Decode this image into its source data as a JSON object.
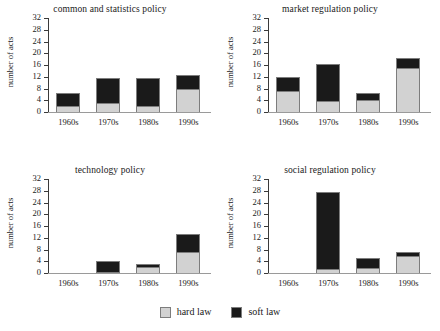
{
  "figure": {
    "ylabel": "number of acts",
    "legend": {
      "hard": {
        "label": "hard law",
        "color": "#d2d2d2",
        "swatch": "hard-law-swatch"
      },
      "soft": {
        "label": "soft law",
        "color": "#1a1a1a",
        "swatch": "soft-law-swatch"
      }
    },
    "yticks": [
      "0",
      "4",
      "8",
      "12",
      "16",
      "20",
      "24",
      "28",
      "32"
    ],
    "xticks": [
      "1960s",
      "1970s",
      "1980s",
      "1990s"
    ]
  },
  "chart_data": [
    {
      "type": "bar",
      "title": "common and statistics policy",
      "xlabel": "",
      "ylabel": "number of acts",
      "ylim": [
        0,
        32
      ],
      "yticks": [
        0,
        4,
        8,
        12,
        16,
        20,
        24,
        28,
        32
      ],
      "grid": false,
      "stacked": true,
      "legend": "figure-bottom",
      "categories": [
        "1960s",
        "1970s",
        "1980s",
        "1990s"
      ],
      "series": [
        {
          "name": "hard law",
          "color": "#d2d2d2",
          "values": [
            2,
            3,
            2,
            8
          ]
        },
        {
          "name": "soft law",
          "color": "#1a1a1a",
          "values": [
            4.5,
            8.5,
            9.5,
            4.5
          ]
        }
      ],
      "totals": [
        6.5,
        11.5,
        11.5,
        12.5
      ]
    },
    {
      "type": "bar",
      "title": "market regulation policy",
      "xlabel": "",
      "ylabel": "number of acts",
      "ylim": [
        0,
        32
      ],
      "yticks": [
        0,
        4,
        8,
        12,
        16,
        20,
        24,
        28,
        32
      ],
      "grid": false,
      "stacked": true,
      "legend": "figure-bottom",
      "categories": [
        "1960s",
        "1970s",
        "1980s",
        "1990s"
      ],
      "series": [
        {
          "name": "hard law",
          "color": "#d2d2d2",
          "values": [
            7,
            3.8,
            4,
            15
          ]
        },
        {
          "name": "soft law",
          "color": "#1a1a1a",
          "values": [
            4.8,
            12.5,
            2.5,
            3.3
          ]
        }
      ],
      "totals": [
        11.8,
        16.3,
        6.5,
        18.3
      ]
    },
    {
      "type": "bar",
      "title": "technology policy",
      "xlabel": "",
      "ylabel": "number of acts",
      "ylim": [
        0,
        32
      ],
      "yticks": [
        0,
        4,
        8,
        12,
        16,
        20,
        24,
        28,
        32
      ],
      "grid": false,
      "stacked": true,
      "legend": "figure-bottom",
      "categories": [
        "1960s",
        "1970s",
        "1980s",
        "1990s"
      ],
      "series": [
        {
          "name": "hard law",
          "color": "#d2d2d2",
          "values": [
            0,
            0,
            2.2,
            7
          ]
        },
        {
          "name": "soft law",
          "color": "#1a1a1a",
          "values": [
            0,
            4,
            1,
            6.3
          ]
        }
      ],
      "totals": [
        0,
        4,
        3.2,
        13.3
      ]
    },
    {
      "type": "bar",
      "title": "social regulation policy",
      "xlabel": "",
      "ylabel": "number of acts",
      "ylim": [
        0,
        32
      ],
      "yticks": [
        0,
        4,
        8,
        12,
        16,
        20,
        24,
        28,
        32
      ],
      "grid": false,
      "stacked": true,
      "legend": "figure-bottom",
      "categories": [
        "1960s",
        "1970s",
        "1980s",
        "1990s"
      ],
      "series": [
        {
          "name": "hard law",
          "color": "#d2d2d2",
          "values": [
            0,
            1.5,
            1.7,
            5.7
          ]
        },
        {
          "name": "soft law",
          "color": "#1a1a1a",
          "values": [
            0,
            26,
            3.3,
            1.3
          ]
        }
      ],
      "totals": [
        0,
        27.5,
        5,
        7
      ]
    }
  ]
}
